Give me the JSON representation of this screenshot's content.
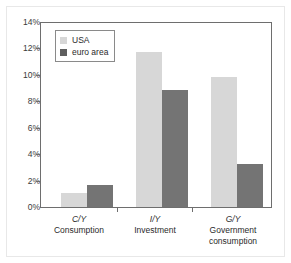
{
  "chart_data": {
    "type": "bar",
    "title": "",
    "xlabel": "",
    "ylabel": "",
    "ylim": [
      0,
      14
    ],
    "grid": false,
    "legend_position": "top-left",
    "categories": [
      "C/Y",
      "I/Y",
      "G/Y"
    ],
    "category_names": [
      "Consumption",
      "Investment",
      "Government consumption"
    ],
    "ytick_labels": [
      "14%",
      "12%",
      "10%",
      "8%",
      "6%",
      "4%",
      "2%",
      "0%"
    ],
    "ytick_values": [
      14,
      12,
      10,
      8,
      6,
      4,
      2,
      0
    ],
    "series": [
      {
        "name": "USA",
        "color": "#d7d7d7",
        "values": [
          1.1,
          11.8,
          9.9
        ]
      },
      {
        "name": "euro area",
        "color": "#747474",
        "values": [
          1.7,
          8.9,
          3.3
        ]
      }
    ]
  },
  "legend": {
    "items": [
      {
        "label": "USA"
      },
      {
        "label": "euro area"
      }
    ]
  },
  "axis": {
    "ticks": [
      {
        "label": "14%"
      },
      {
        "label": "12%"
      },
      {
        "label": "10%"
      },
      {
        "label": "8%"
      },
      {
        "label": "6%"
      },
      {
        "label": "4%"
      },
      {
        "label": "2%"
      },
      {
        "label": "0%"
      }
    ]
  },
  "categories": [
    {
      "ratio": "C/Y",
      "name": "Consumption"
    },
    {
      "ratio": "I/Y",
      "name": "Investment"
    },
    {
      "ratio": "G/Y",
      "name": "Government consumption"
    }
  ]
}
